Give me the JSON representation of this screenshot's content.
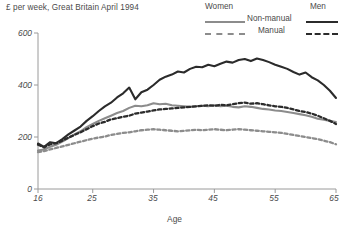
{
  "title": "£ per week, Great Britain April 1994",
  "legend": {
    "col_women": "Women",
    "col_men": "Men",
    "row_nonmanual": "Non-manual",
    "row_manual": "Manual"
  },
  "colors": {
    "women": "#8c8c8c",
    "men": "#2b2b2b",
    "axis": "#9a9a9a",
    "text": "#4a4a4a"
  },
  "axes": {
    "y_ticks": [
      "0",
      "200",
      "400",
      "600"
    ],
    "x_ticks": [
      "16",
      "25",
      "35",
      "45",
      "55",
      "65"
    ],
    "x_title": "Age"
  },
  "chart_data": {
    "type": "line",
    "title": "£ per week, Great Britain April 1994",
    "xlabel": "Age",
    "ylabel": "",
    "xlim": [
      16,
      65
    ],
    "ylim": [
      0,
      600
    ],
    "grid": false,
    "legend_position": "top-right",
    "x": [
      16,
      17,
      18,
      19,
      20,
      21,
      22,
      23,
      24,
      25,
      26,
      27,
      28,
      29,
      30,
      31,
      32,
      33,
      34,
      35,
      36,
      37,
      38,
      39,
      40,
      41,
      42,
      43,
      44,
      45,
      46,
      47,
      48,
      49,
      50,
      51,
      52,
      53,
      54,
      55,
      56,
      57,
      58,
      59,
      60,
      61,
      62,
      63,
      64,
      65
    ],
    "series": [
      {
        "name": "Men Non-manual",
        "style": "solid",
        "color": "#2b2b2b",
        "values": [
          175,
          162,
          180,
          176,
          192,
          210,
          225,
          240,
          262,
          280,
          300,
          318,
          332,
          352,
          368,
          390,
          345,
          372,
          382,
          400,
          420,
          432,
          440,
          452,
          448,
          462,
          470,
          468,
          478,
          472,
          482,
          490,
          486,
          496,
          500,
          492,
          502,
          496,
          488,
          478,
          470,
          462,
          450,
          440,
          448,
          430,
          418,
          400,
          378,
          350
        ]
      },
      {
        "name": "Women Non-manual",
        "style": "solid",
        "color": "#8c8c8c",
        "values": [
          148,
          152,
          162,
          170,
          182,
          196,
          210,
          222,
          238,
          250,
          262,
          272,
          282,
          292,
          300,
          312,
          320,
          318,
          322,
          330,
          326,
          328,
          322,
          320,
          318,
          316,
          318,
          320,
          318,
          322,
          318,
          320,
          316,
          314,
          318,
          316,
          312,
          308,
          306,
          302,
          300,
          296,
          292,
          288,
          284,
          278,
          270,
          266,
          262,
          258
        ]
      },
      {
        "name": "Men Manual",
        "style": "dashed",
        "color": "#2b2b2b",
        "values": [
          170,
          160,
          172,
          176,
          186,
          198,
          208,
          218,
          230,
          242,
          252,
          258,
          268,
          272,
          278,
          282,
          290,
          294,
          298,
          302,
          306,
          308,
          310,
          312,
          314,
          316,
          318,
          320,
          322,
          320,
          324,
          322,
          326,
          330,
          332,
          328,
          330,
          326,
          322,
          318,
          316,
          312,
          306,
          300,
          296,
          290,
          282,
          272,
          262,
          250
        ]
      },
      {
        "name": "Women Manual",
        "style": "dashed",
        "color": "#8c8c8c",
        "values": [
          142,
          146,
          152,
          158,
          164,
          170,
          176,
          182,
          188,
          194,
          198,
          202,
          208,
          212,
          216,
          218,
          222,
          226,
          228,
          230,
          228,
          226,
          224,
          222,
          224,
          226,
          228,
          226,
          228,
          230,
          228,
          226,
          228,
          230,
          228,
          226,
          224,
          222,
          220,
          218,
          216,
          212,
          208,
          204,
          200,
          196,
          192,
          186,
          180,
          172
        ]
      }
    ]
  }
}
